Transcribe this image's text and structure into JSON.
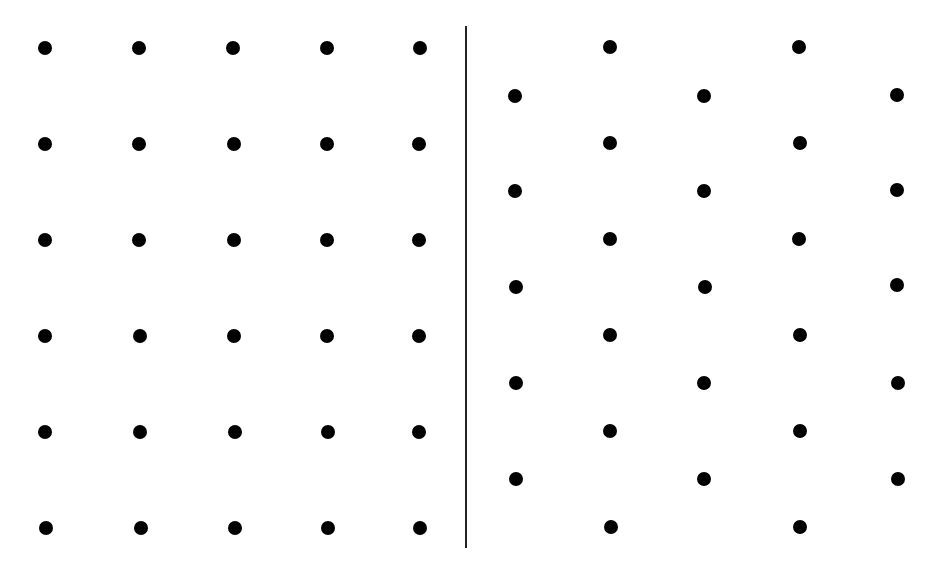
{
  "diagram": {
    "title": "",
    "background": "#ffffff",
    "dot_color": "#000000",
    "dot_diameter": 14,
    "divider": {
      "x": 466,
      "y1": 26,
      "y2": 548,
      "color": "#222222"
    },
    "panels": [
      {
        "name": "square-lattice",
        "columns_x": [
          45,
          139,
          233,
          327,
          420
        ],
        "rows_y": [
          48,
          144,
          240,
          336,
          432,
          528
        ],
        "dots": [
          [
            45,
            48
          ],
          [
            139,
            48
          ],
          [
            233,
            48
          ],
          [
            327,
            48
          ],
          [
            420,
            48
          ],
          [
            45,
            144
          ],
          [
            139,
            144
          ],
          [
            234,
            144
          ],
          [
            327,
            144
          ],
          [
            419,
            144
          ],
          [
            45,
            240
          ],
          [
            139,
            240
          ],
          [
            234,
            240
          ],
          [
            327,
            240
          ],
          [
            419,
            240
          ],
          [
            45,
            336
          ],
          [
            140,
            336
          ],
          [
            234,
            336
          ],
          [
            327,
            336
          ],
          [
            419,
            336
          ],
          [
            45,
            432
          ],
          [
            140,
            432
          ],
          [
            235,
            432
          ],
          [
            328,
            432
          ],
          [
            419,
            432
          ],
          [
            46,
            528
          ],
          [
            141,
            528
          ],
          [
            235,
            528
          ],
          [
            328,
            528
          ],
          [
            420,
            528
          ]
        ]
      },
      {
        "name": "hexagonal-lattice",
        "dots": [
          [
            610,
            47
          ],
          [
            799,
            47
          ],
          [
            515,
            96
          ],
          [
            704,
            96
          ],
          [
            897,
            95
          ],
          [
            610,
            143
          ],
          [
            800,
            143
          ],
          [
            515,
            191
          ],
          [
            704,
            191
          ],
          [
            897,
            190
          ],
          [
            610,
            239
          ],
          [
            799,
            239
          ],
          [
            516,
            287
          ],
          [
            705,
            287
          ],
          [
            897,
            285
          ],
          [
            610,
            335
          ],
          [
            800,
            335
          ],
          [
            516,
            383
          ],
          [
            704,
            383
          ],
          [
            898,
            383
          ],
          [
            610,
            431
          ],
          [
            800,
            431
          ],
          [
            516,
            479
          ],
          [
            704,
            479
          ],
          [
            898,
            479
          ],
          [
            611,
            527
          ],
          [
            800,
            527
          ]
        ]
      }
    ]
  }
}
